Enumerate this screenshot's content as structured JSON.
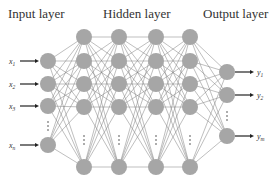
{
  "diagram": {
    "type": "neural-network",
    "titles": {
      "input": "Input layer",
      "hidden": "Hidden layer",
      "output": "Output layer"
    },
    "inputs": [
      "x1",
      "x2",
      "x3",
      "xn"
    ],
    "outputs": [
      "y1",
      "y2",
      "ym"
    ],
    "hidden_layer_count": 4,
    "colors": {
      "node": "#a6a6a6",
      "edge": "#555555",
      "arrow": "#222222",
      "text": "#333333"
    }
  }
}
